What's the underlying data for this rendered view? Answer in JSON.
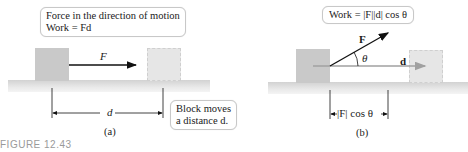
{
  "panel_a": {
    "callout_line1": "Force in the direction of motion",
    "callout_line2": "Work = Fd",
    "force_label": "F",
    "distance_label": "d",
    "note_line1": "Block moves",
    "note_line2": "a distance d.",
    "caption": "(a)"
  },
  "panel_b": {
    "callout": "Work = |F||d| cos θ",
    "force_label": "F",
    "displacement_label": "d",
    "angle_label": "θ",
    "projection_label": "|F| cos θ",
    "caption": "(b)"
  },
  "figure_label": "FIGURE 12.43",
  "colors": {
    "block_solid": "#c9c9c9",
    "block_ghost": "#e6e6e6",
    "ground": "#dcdcdc",
    "arrow": "#111111",
    "d_arrow": "#a0a0a0"
  }
}
